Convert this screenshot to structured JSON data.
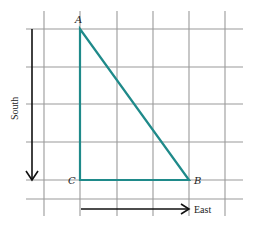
{
  "diagram": {
    "type": "right-triangle-on-grid",
    "grid": {
      "columns": 5,
      "rows": 5,
      "line_color": "#9a9a9a"
    },
    "triangle": {
      "color": "#1f8a8a",
      "vertices": {
        "A": {
          "label": "A",
          "grid": [
            1,
            0
          ]
        },
        "C": {
          "label": "C",
          "grid": [
            1,
            4
          ]
        },
        "B": {
          "label": "B",
          "grid": [
            4,
            4
          ]
        }
      }
    },
    "axes": {
      "south": {
        "label": "South",
        "direction": "down"
      },
      "east": {
        "label": "East",
        "direction": "right"
      }
    }
  }
}
